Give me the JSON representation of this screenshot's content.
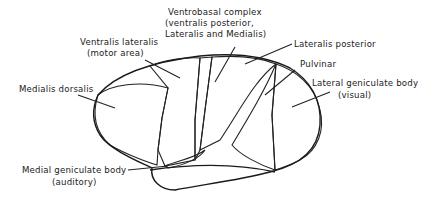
{
  "figure": {
    "labels": {
      "ventrobasal": [
        "Ventrobasal complex",
        "(ventralis posterior,",
        "Lateralis and Medialis)"
      ],
      "ventralis_lateralis": [
        "Ventralis lateralis",
        "(motor area)"
      ],
      "lateralis_posterior": [
        "Lateralis posterior"
      ],
      "pulvinar": [
        "Pulvinar"
      ],
      "lateral_geniculate": [
        "Lateral geniculate body",
        "(visual)"
      ],
      "medialis_dorsalis": [
        "Medialis dorsalis"
      ],
      "medial_geniculate": [
        "Medial geniculate body",
        "(auditory)"
      ]
    },
    "colors": {
      "ink": "#222222",
      "background": "#ffffff"
    }
  }
}
